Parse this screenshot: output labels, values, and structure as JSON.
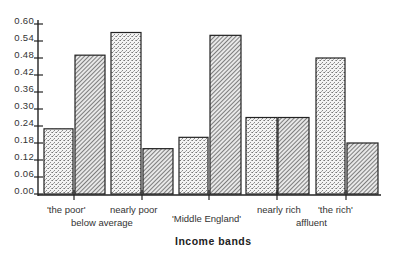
{
  "chart_data": {
    "type": "bar",
    "title": "",
    "xlabel": "Income bands",
    "ylabel": "",
    "ylim": [
      0,
      0.6
    ],
    "yticks": [
      "0.00",
      "0.06",
      "0.12",
      "0.18",
      "0.24",
      "0.30",
      "0.36",
      "0.42",
      "0.48",
      "0.54",
      "0.60"
    ],
    "categories": [
      "'the poor'",
      "nearly poor",
      "'Middle England'",
      "nearly rich",
      "'the rich'"
    ],
    "category_groups": [
      {
        "label": "below average",
        "categories": [
          "'the poor'",
          "nearly poor"
        ]
      },
      {
        "label": "affluent",
        "categories": [
          "nearly rich",
          "'the rich'"
        ]
      }
    ],
    "series": [
      {
        "name": "dotted",
        "pattern": "stipple",
        "values": [
          0.23,
          0.57,
          0.2,
          0.27,
          0.48
        ]
      },
      {
        "name": "hatched",
        "pattern": "diagonal-hatch",
        "values": [
          0.49,
          0.16,
          0.56,
          0.27,
          0.18
        ]
      }
    ],
    "grid": false,
    "legend": "none"
  },
  "labels": {
    "x_title": "Income bands",
    "group_below": "below average",
    "group_affluent": "affluent",
    "cat_0": "'the poor'",
    "cat_1": "nearly poor",
    "cat_2": "'Middle England'",
    "cat_3": "nearly rich",
    "cat_4": "'the rich'"
  }
}
